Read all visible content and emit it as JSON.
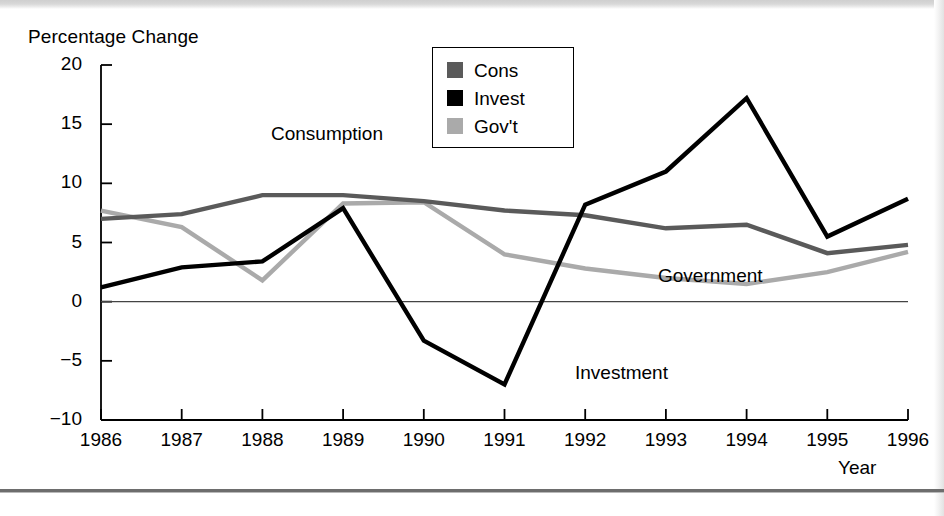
{
  "figure": {
    "background_color": "#ffffff",
    "axis_color": "#000000"
  },
  "legend": {
    "position": "top-center-right",
    "items": [
      {
        "label": "Cons",
        "color": "#5a5a5a",
        "swatch_name": "legend-swatch-cons"
      },
      {
        "label": "Invest",
        "color": "#000000",
        "swatch_name": "legend-swatch-invest"
      },
      {
        "label": "Gov't",
        "color": "#aaaaaa",
        "swatch_name": "legend-swatch-govt"
      }
    ]
  },
  "annotations": [
    {
      "text": "Consumption",
      "name": "annotation-consumption"
    },
    {
      "text": "Government",
      "name": "annotation-government"
    },
    {
      "text": "Investment",
      "name": "annotation-investment"
    }
  ],
  "chart_data": {
    "type": "line",
    "title": "",
    "xlabel": "Year",
    "ylabel": "Percentage Change",
    "x": [
      1986,
      1987,
      1988,
      1989,
      1990,
      1991,
      1992,
      1993,
      1994,
      1995,
      1996
    ],
    "categories": [
      "1986",
      "1987",
      "1988",
      "1989",
      "1990",
      "1991",
      "1992",
      "1993",
      "1994",
      "1995",
      "1996"
    ],
    "xlim": [
      1986,
      1996
    ],
    "ylim": [
      -10,
      20
    ],
    "yticks": [
      20,
      15,
      10,
      5,
      0,
      -5,
      -10
    ],
    "ytick_labels": [
      "20",
      "15",
      "10",
      "5",
      "0",
      "−5",
      "−10"
    ],
    "grid": false,
    "zero_line": true,
    "series": [
      {
        "name": "Cons",
        "display_name": "Consumption",
        "color": "#5a5a5a",
        "values": [
          7.0,
          7.4,
          9.0,
          9.0,
          8.5,
          7.7,
          7.3,
          6.2,
          6.5,
          4.1,
          4.8
        ]
      },
      {
        "name": "Invest",
        "display_name": "Investment",
        "color": "#000000",
        "values": [
          1.2,
          2.9,
          3.4,
          7.9,
          -3.3,
          -7.0,
          8.2,
          11.0,
          17.2,
          5.5,
          8.7
        ]
      },
      {
        "name": "Gov't",
        "display_name": "Government",
        "color": "#aaaaaa",
        "values": [
          7.7,
          6.3,
          1.8,
          8.3,
          8.4,
          4.0,
          2.8,
          2.0,
          1.5,
          2.5,
          4.2
        ]
      }
    ]
  }
}
